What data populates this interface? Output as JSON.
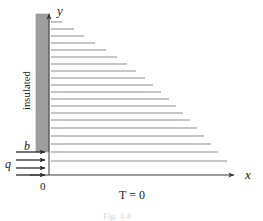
{
  "figure": {
    "type": "technical-diagram",
    "background_color": "#ffffff",
    "labels": {
      "y_axis": "y",
      "x_axis": "x",
      "origin": "0",
      "wall_height": "b",
      "heat_flux": "q",
      "boundary_temperature": "T = 0",
      "insulated_wall": "insulated",
      "caption": "Fig. 4.4"
    },
    "colors": {
      "wall_fill": "#9e9e9e",
      "wall_stroke": "#8a8a8a",
      "axis": "#3a3a3a",
      "arrow": "#2b2b2b",
      "isotherm": "#8c8c99",
      "text": "#1a1a1a",
      "caption": "#dcdcdc"
    },
    "geometry": {
      "origin_x": 49,
      "origin_y": 175,
      "y_axis_top": 12,
      "x_axis_right": 238,
      "wall_left": 36,
      "wall_right": 49,
      "wall_top": 14,
      "wall_bottom": 152
    },
    "isotherms": {
      "count": 20,
      "start_x": 51,
      "note": "horizontal streamlines whose right ends form a diagonal envelope, increasing in length from top to bottom",
      "lines": [
        {
          "y": 22,
          "x_end": 62
        },
        {
          "y": 29,
          "x_end": 74
        },
        {
          "y": 36,
          "x_end": 84
        },
        {
          "y": 43,
          "x_end": 95
        },
        {
          "y": 50,
          "x_end": 106
        },
        {
          "y": 57,
          "x_end": 117
        },
        {
          "y": 64,
          "x_end": 127
        },
        {
          "y": 71,
          "x_end": 136
        },
        {
          "y": 78,
          "x_end": 145
        },
        {
          "y": 85,
          "x_end": 153
        },
        {
          "y": 92,
          "x_end": 161
        },
        {
          "y": 99,
          "x_end": 169
        },
        {
          "y": 106,
          "x_end": 176
        },
        {
          "y": 113,
          "x_end": 183
        },
        {
          "y": 120,
          "x_end": 190
        },
        {
          "y": 128,
          "x_end": 197
        },
        {
          "y": 136,
          "x_end": 204
        },
        {
          "y": 144,
          "x_end": 211
        },
        {
          "y": 152,
          "x_end": 218
        },
        {
          "y": 161,
          "x_end": 227
        }
      ]
    },
    "flux_arrows": {
      "count": 4,
      "start_x": 16,
      "end_x": 49,
      "ys": [
        152,
        160,
        168,
        175
      ]
    }
  }
}
